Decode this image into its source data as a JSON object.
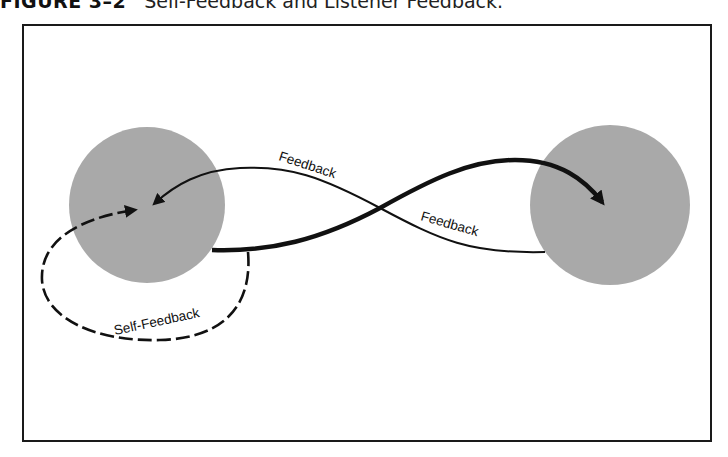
{
  "caption": {
    "figure_number": "FIGURE 3–2",
    "title": "Self-Feedback and Listener Feedback."
  },
  "diagram": {
    "nodes": [
      {
        "id": "speaker",
        "shape": "circle",
        "fill": "#a9a9a9"
      },
      {
        "id": "listener",
        "shape": "circle",
        "fill": "#a9a9a9"
      }
    ],
    "edges": [
      {
        "id": "message",
        "from": "speaker",
        "to": "listener",
        "style": "thick-solid",
        "label": ""
      },
      {
        "id": "listener-feedback",
        "from": "listener",
        "to": "speaker",
        "style": "thin-solid",
        "labels": [
          "Feedback",
          "Feedback"
        ]
      },
      {
        "id": "self-feedback",
        "from": "speaker",
        "to": "speaker",
        "style": "dashed",
        "label": "Self-Feedback"
      }
    ],
    "labels": {
      "feedback_upper": "Feedback",
      "feedback_lower": "Feedback",
      "self_feedback": "Self-Feedback"
    },
    "colors": {
      "circle_fill": "#a9a9a9",
      "line": "#111111",
      "frame": "#1a1a1a"
    }
  }
}
